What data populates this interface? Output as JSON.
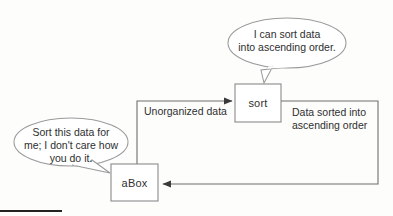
{
  "diagram": {
    "background_color": "#fdfdfc",
    "stroke_color": "#8a8a8a",
    "text_color": "#2f2f2f",
    "arrow_color": "#3a3a3a"
  },
  "nodes": [
    {
      "id": "sort",
      "label": "sort",
      "shape": "rectangle",
      "x": 235,
      "y": 84,
      "width": 46,
      "height": 38
    },
    {
      "id": "abox",
      "label": "aBox",
      "shape": "rectangle",
      "x": 111,
      "y": 164,
      "width": 47,
      "height": 37
    }
  ],
  "speech_bubbles": [
    {
      "id": "sort-bubble",
      "speaker": "sort",
      "lines": [
        "I can sort data",
        "into ascending order."
      ],
      "text": "I can sort data into ascending order.",
      "shape": "ellipse",
      "cx": 287,
      "cy": 43,
      "rx": 59,
      "ry": 25,
      "tail_to": {
        "x": 264,
        "y": 83
      }
    },
    {
      "id": "abox-bubble",
      "speaker": "aBox",
      "lines": [
        "Sort this data for",
        "me; I don't care how",
        "you do it."
      ],
      "text": "Sort this data for me; I don't care how you do it.",
      "shape": "ellipse",
      "cx": 71,
      "cy": 142,
      "rx": 57,
      "ry": 24,
      "tail_to": {
        "x": 110,
        "y": 173
      }
    }
  ],
  "edges": [
    {
      "id": "abox-to-sort",
      "from": "aBox",
      "to": "sort",
      "label": "Unorganized data",
      "label_lines": [
        "Unorganized data"
      ],
      "arrowhead": "end",
      "direction": "up-then-right"
    },
    {
      "id": "sort-to-abox",
      "from": "sort",
      "to": "aBox",
      "label": "Data sorted into ascending order",
      "label_lines": [
        "Data sorted into",
        "ascending order"
      ],
      "arrowhead": "end",
      "direction": "right-then-down-then-left"
    }
  ],
  "decorations": [
    {
      "id": "bottom-rule",
      "kind": "horizontal-bar",
      "color": "#262420"
    }
  ]
}
